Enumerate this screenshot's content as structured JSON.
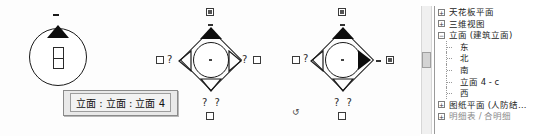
{
  "app": {
    "type": "cad-elevation-markers"
  },
  "tooltip": {
    "text": "立面 : 立面 : 立面 4"
  },
  "markers": [
    {
      "id": "marker-1",
      "name": "elevation-marker-circle",
      "shape": "circle",
      "active_direction": "up",
      "badge": "center-badge",
      "top_dash": "-"
    },
    {
      "id": "marker-2",
      "name": "elevation-marker-diamond-up",
      "shape": "diamond",
      "active_direction": "up",
      "checkbox_top": "checked",
      "checkbox_left": "unchecked",
      "checkbox_right": "unchecked",
      "checkbox_bottom": "unchecked",
      "qmark_left": "?",
      "qmark_right": "?",
      "qmark_bottom": "? ?",
      "rotate_glyph": "↺"
    },
    {
      "id": "marker-3",
      "name": "elevation-marker-diamond-right",
      "shape": "diamond",
      "active_direction": "right",
      "checkbox_top": "checked",
      "checkbox_left": "unchecked",
      "checkbox_right": "checked",
      "checkbox_bottom": "unchecked",
      "qmark_left": "?",
      "qmark_bottom": "? ?",
      "rotate_glyph": "↺"
    }
  ],
  "glyphs": {
    "question": "?",
    "rotate": "↺",
    "dash": "-",
    "expander_plus": "+",
    "expander_minus": "−"
  },
  "browser": {
    "title": "project-browser-tree",
    "nodes": [
      {
        "label": "天花板平面",
        "level": 0,
        "expander": "+"
      },
      {
        "label": "三维视图",
        "level": 0,
        "expander": "+"
      },
      {
        "label": "立面 (建筑立面)",
        "level": 0,
        "expander": "−"
      },
      {
        "label": "东",
        "level": 1,
        "expander": ""
      },
      {
        "label": "北",
        "level": 1,
        "expander": ""
      },
      {
        "label": "南",
        "level": 1,
        "expander": ""
      },
      {
        "label": "立面 4 - c",
        "level": 1,
        "expander": ""
      },
      {
        "label": "西",
        "level": 1,
        "expander": ""
      },
      {
        "label": "图纸平面 (人防结…",
        "level": 0,
        "expander": "+"
      },
      {
        "label": "明细表 / 合明细",
        "level": 0,
        "expander": "+"
      }
    ]
  }
}
